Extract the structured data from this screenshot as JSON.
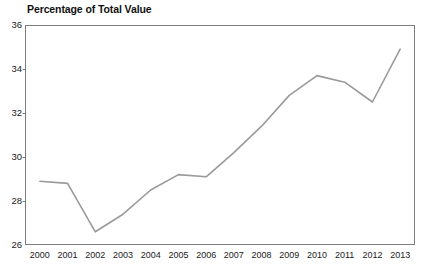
{
  "chart_data": {
    "type": "line",
    "title": "Percentage of Total Value",
    "xlabel": "",
    "ylabel": "",
    "categories": [
      "2000",
      "2001",
      "2002",
      "2003",
      "2004",
      "2005",
      "2006",
      "2007",
      "2008",
      "2009",
      "2010",
      "2011",
      "2012",
      "2013"
    ],
    "values": [
      28.9,
      28.8,
      26.6,
      27.4,
      28.5,
      29.2,
      29.1,
      30.2,
      31.4,
      32.8,
      33.7,
      33.4,
      32.5,
      34.9
    ],
    "ylim": [
      26,
      36
    ],
    "yticks": [
      26,
      28,
      30,
      32,
      34,
      36
    ],
    "ytick_labels": [
      "26",
      "28",
      "30",
      "32",
      "34",
      "36"
    ],
    "grid": false,
    "legend": false,
    "markers": false,
    "line_color": "#9a9a9a",
    "frame_color": "#7d7d7d",
    "text_color": "#1a1a1a"
  }
}
